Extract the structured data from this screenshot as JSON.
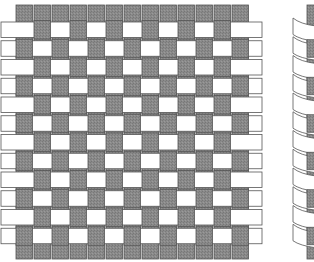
{
  "figure": {
    "type": "plain-weave-diagram",
    "panels": [
      {
        "id": "flat-weave",
        "view": "top-down",
        "warp_count": 13,
        "weft_count": 12,
        "pattern": "plain (1 over, 1 under)"
      },
      {
        "id": "curved-weave",
        "view": "perspective (partially visible, cropped at right)"
      }
    ]
  },
  "colors": {
    "background": "#ffffff",
    "warp_fill": "#8a8a8a",
    "weft_fill": "#ffffff",
    "stroke": "#555555"
  },
  "layout": {
    "warp_x0": 16,
    "warp_pitch": 18.0,
    "warp_width": 16.5,
    "warp_top": 5,
    "warp_bottom": 259,
    "weft_y0": 22,
    "weft_pitch": 18.75,
    "weft_height": 15.5,
    "weft_left": 1,
    "weft_right": 262
  }
}
